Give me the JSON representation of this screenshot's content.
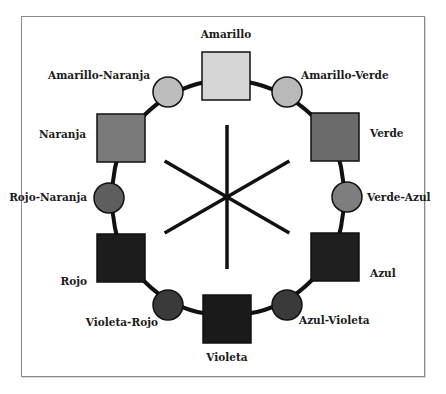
{
  "diagram": {
    "center_lines": 3,
    "nodes": [
      {
        "id": "amarillo",
        "label": "Amarillo",
        "shape": "square",
        "color": "#d6d6d6",
        "x": 202,
        "y": 52,
        "size": 48,
        "lx": 226,
        "ly": 38,
        "anchor": "middle"
      },
      {
        "id": "amarillo-verde",
        "label": "Amarillo-Verde",
        "shape": "circle",
        "color": "#b9b9b9",
        "cx": 287,
        "cy": 92,
        "r": 15,
        "lx": 301,
        "ly": 79,
        "anchor": "start"
      },
      {
        "id": "verde",
        "label": "Verde",
        "shape": "square",
        "color": "#6b6b6b",
        "x": 311,
        "y": 113,
        "size": 48,
        "lx": 370,
        "ly": 137,
        "anchor": "start"
      },
      {
        "id": "verde-azul",
        "label": "Verde-Azul",
        "shape": "circle",
        "color": "#7e7e7e",
        "cx": 347,
        "cy": 197,
        "r": 15,
        "lx": 367,
        "ly": 201,
        "anchor": "start"
      },
      {
        "id": "azul",
        "label": "Azul",
        "shape": "square",
        "color": "#1f1f1f",
        "x": 311,
        "y": 233,
        "size": 48,
        "lx": 370,
        "ly": 277,
        "anchor": "start"
      },
      {
        "id": "azul-violeta",
        "label": "Azul-Violeta",
        "shape": "circle",
        "color": "#3a3a3a",
        "cx": 287,
        "cy": 305,
        "r": 15,
        "lx": 299,
        "ly": 324,
        "anchor": "start"
      },
      {
        "id": "violeta",
        "label": "Violeta",
        "shape": "square",
        "color": "#1a1a1a",
        "x": 203,
        "y": 295,
        "size": 48,
        "lx": 227,
        "ly": 361,
        "anchor": "middle"
      },
      {
        "id": "violeta-rojo",
        "label": "Violeta-Rojo",
        "shape": "circle",
        "color": "#3a3a3a",
        "cx": 168,
        "cy": 305,
        "r": 15,
        "lx": 158,
        "ly": 326,
        "anchor": "end"
      },
      {
        "id": "rojo",
        "label": "Rojo",
        "shape": "square",
        "color": "#1c1c1c",
        "x": 97,
        "y": 234,
        "size": 48,
        "lx": 87,
        "ly": 285,
        "anchor": "end"
      },
      {
        "id": "rojo-naranja",
        "label": "Rojo-Naranja",
        "shape": "circle",
        "color": "#5e5e5e",
        "cx": 109,
        "cy": 198,
        "r": 15,
        "lx": 87,
        "ly": 201,
        "anchor": "end"
      },
      {
        "id": "naranja",
        "label": "Naranja",
        "shape": "square",
        "color": "#7a7a7a",
        "x": 97,
        "y": 114,
        "size": 48,
        "lx": 86,
        "ly": 138,
        "anchor": "end"
      },
      {
        "id": "amarillo-naranja",
        "label": "Amarillo-Naranja",
        "shape": "circle",
        "color": "#bdbdbd",
        "cx": 168,
        "cy": 92,
        "r": 15,
        "lx": 150,
        "ly": 79,
        "anchor": "end"
      }
    ],
    "ring": {
      "cx": 227,
      "cy": 197,
      "rx": 121,
      "ry": 105,
      "stroke": "#111111",
      "width": 4
    },
    "asterisk": {
      "cx": 227,
      "cy": 197,
      "len": 72,
      "stroke": "#111111",
      "width": 3.5
    }
  }
}
